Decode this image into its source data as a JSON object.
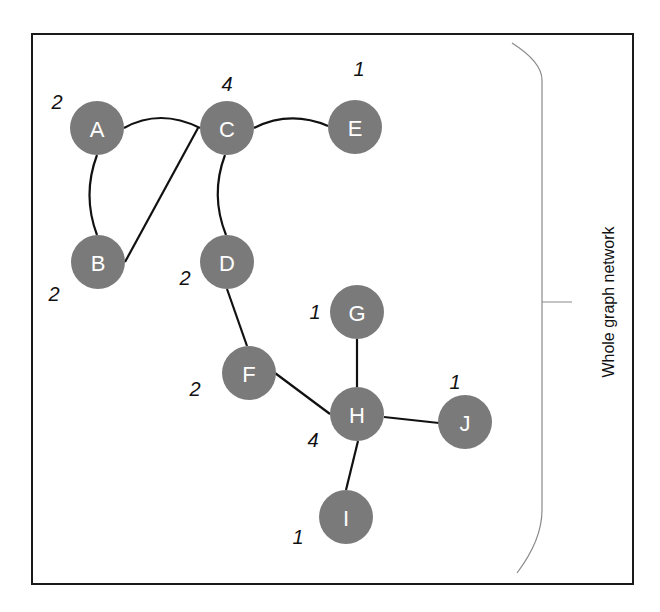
{
  "diagram": {
    "side_label": "Whole graph network",
    "colors": {
      "node": "#7a7a7a",
      "edge": "#111111",
      "node_text": "#ffffff",
      "frame": "#1a1a1a",
      "brace": "#8a8a8a"
    },
    "nodes": [
      {
        "id": "A",
        "label": "A",
        "degree": "2",
        "x": 97,
        "y": 128,
        "dx": -40,
        "dy": -26
      },
      {
        "id": "B",
        "label": "B",
        "degree": "2",
        "x": 98,
        "y": 262,
        "dx": -44,
        "dy": 32
      },
      {
        "id": "C",
        "label": "C",
        "degree": "4",
        "x": 227,
        "y": 128,
        "dx": 0,
        "dy": -44
      },
      {
        "id": "D",
        "label": "D",
        "degree": "2",
        "x": 227,
        "y": 262,
        "dx": -42,
        "dy": 16
      },
      {
        "id": "E",
        "label": "E",
        "degree": "1",
        "x": 355,
        "y": 127,
        "dx": 4,
        "dy": -58
      },
      {
        "id": "F",
        "label": "F",
        "degree": "2",
        "x": 249,
        "y": 373,
        "dx": -54,
        "dy": 16
      },
      {
        "id": "G",
        "label": "G",
        "degree": "1",
        "x": 357,
        "y": 312,
        "dx": -42,
        "dy": 0
      },
      {
        "id": "H",
        "label": "H",
        "degree": "4",
        "x": 357,
        "y": 414,
        "dx": -44,
        "dy": 26
      },
      {
        "id": "I",
        "label": "I",
        "degree": "1",
        "x": 346,
        "y": 517,
        "dx": -48,
        "dy": 20
      },
      {
        "id": "J",
        "label": "J",
        "degree": "1",
        "x": 465,
        "y": 422,
        "dx": -10,
        "dy": -40
      }
    ],
    "edges": [
      {
        "from": "A",
        "to": "C",
        "path": "M124,128 Q160,108 200,128"
      },
      {
        "from": "A",
        "to": "B",
        "path": "M97,155 Q82,195 97,235"
      },
      {
        "from": "B",
        "to": "C",
        "path": "M125,262 L198,128"
      },
      {
        "from": "C",
        "to": "E",
        "path": "M254,128 Q290,110 328,126"
      },
      {
        "from": "C",
        "to": "D",
        "path": "M225,155 Q210,195 226,235"
      },
      {
        "from": "D",
        "to": "F",
        "path": "M227,289 L247,346"
      },
      {
        "from": "F",
        "to": "H",
        "path": "M275,373 L330,414"
      },
      {
        "from": "G",
        "to": "H",
        "path": "M357,339 L357,387"
      },
      {
        "from": "H",
        "to": "J",
        "path": "M384,417 L439,423"
      },
      {
        "from": "H",
        "to": "I",
        "path": "M358,441 L346,490"
      }
    ]
  }
}
